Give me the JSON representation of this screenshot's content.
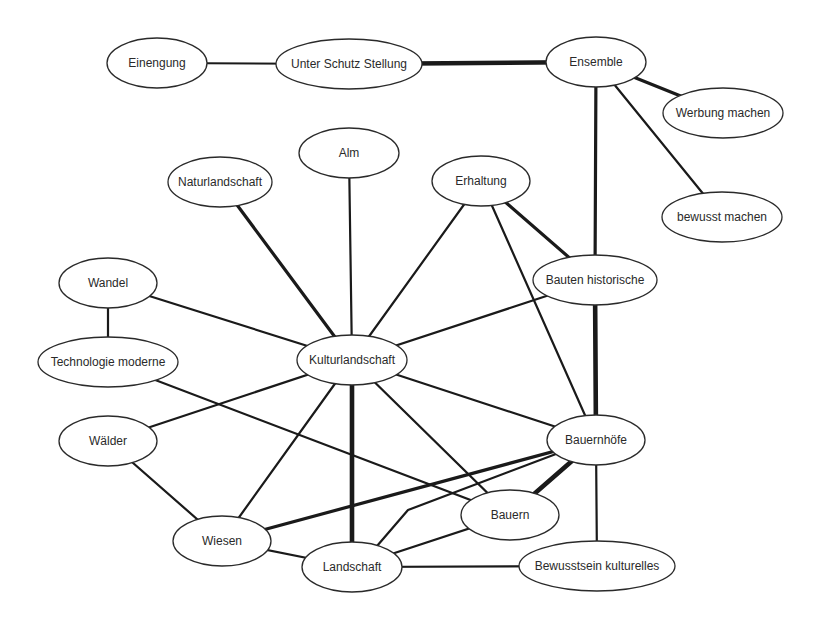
{
  "diagram": {
    "type": "concept-network",
    "nodes": [
      {
        "id": "einengung",
        "label": "Einengung"
      },
      {
        "id": "unter_schutz",
        "label": "Unter Schutz Stellung"
      },
      {
        "id": "ensemble",
        "label": "Ensemble"
      },
      {
        "id": "werbung",
        "label": "Werbung machen"
      },
      {
        "id": "bewusst",
        "label": "bewusst machen"
      },
      {
        "id": "alm",
        "label": "Alm"
      },
      {
        "id": "naturlandschaft",
        "label": "Naturlandschaft"
      },
      {
        "id": "erhaltung",
        "label": "Erhaltung"
      },
      {
        "id": "wandel",
        "label": "Wandel"
      },
      {
        "id": "bauten",
        "label": "Bauten historische"
      },
      {
        "id": "technologie",
        "label": "Technologie moderne"
      },
      {
        "id": "kulturlandschaft",
        "label": "Kulturlandschaft"
      },
      {
        "id": "waelder",
        "label": "Wälder"
      },
      {
        "id": "bauernhoefe",
        "label": "Bauernhöfe"
      },
      {
        "id": "bauern",
        "label": "Bauern"
      },
      {
        "id": "wiesen",
        "label": "Wiesen"
      },
      {
        "id": "landschaft",
        "label": "Landschaft"
      },
      {
        "id": "bewusstsein",
        "label": "Bewusstsein kulturelles"
      }
    ],
    "edges": [
      {
        "from": "einengung",
        "to": "unter_schutz",
        "weight": 2
      },
      {
        "from": "unter_schutz",
        "to": "ensemble",
        "weight": 4
      },
      {
        "from": "ensemble",
        "to": "werbung",
        "weight": 3
      },
      {
        "from": "ensemble",
        "to": "bewusst",
        "weight": 2
      },
      {
        "from": "ensemble",
        "to": "bauten",
        "weight": 3
      },
      {
        "from": "naturlandschaft",
        "to": "kulturlandschaft",
        "weight": 3
      },
      {
        "from": "alm",
        "to": "kulturlandschaft",
        "weight": 2
      },
      {
        "from": "erhaltung",
        "to": "kulturlandschaft",
        "weight": 2
      },
      {
        "from": "erhaltung",
        "to": "bauten",
        "weight": 3
      },
      {
        "from": "erhaltung",
        "to": "bauernhoefe",
        "weight": 2
      },
      {
        "from": "wandel",
        "to": "kulturlandschaft",
        "weight": 2
      },
      {
        "from": "wandel",
        "to": "technologie",
        "weight": 2
      },
      {
        "from": "bauten",
        "to": "kulturlandschaft",
        "weight": 2
      },
      {
        "from": "bauten",
        "to": "bauernhoefe",
        "weight": 4
      },
      {
        "from": "technologie",
        "to": "bauern",
        "weight": 2
      },
      {
        "from": "kulturlandschaft",
        "to": "waelder",
        "weight": 2
      },
      {
        "from": "kulturlandschaft",
        "to": "wiesen",
        "weight": 2
      },
      {
        "from": "kulturlandschaft",
        "to": "landschaft",
        "weight": 4
      },
      {
        "from": "kulturlandschaft",
        "to": "bauern",
        "weight": 2
      },
      {
        "from": "kulturlandschaft",
        "to": "bauernhoefe",
        "weight": 2
      },
      {
        "from": "waelder",
        "to": "wiesen",
        "weight": 2
      },
      {
        "from": "bauernhoefe",
        "to": "wiesen",
        "weight": 3
      },
      {
        "from": "bauernhoefe",
        "to": "landschaft",
        "weight": 2,
        "bent": true
      },
      {
        "from": "bauernhoefe",
        "to": "bauern",
        "weight": 4
      },
      {
        "from": "bauernhoefe",
        "to": "bewusstsein",
        "weight": 2
      },
      {
        "from": "wiesen",
        "to": "landschaft",
        "weight": 2
      },
      {
        "from": "bauern",
        "to": "landschaft",
        "weight": 2
      },
      {
        "from": "landschaft",
        "to": "bewusstsein",
        "weight": 2
      }
    ]
  }
}
